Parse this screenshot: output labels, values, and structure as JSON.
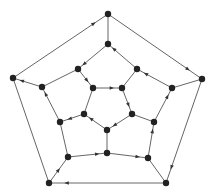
{
  "diagram": {
    "type": "graph",
    "colors": {
      "edge": "#555555",
      "node": "#222222",
      "arrow": "#333333",
      "background": "#ffffff"
    },
    "node_radius": 3.2,
    "nodes": [
      {
        "id": "n0",
        "x": 108,
        "y": 14
      },
      {
        "id": "n1",
        "x": 202,
        "y": 79
      },
      {
        "id": "n2",
        "x": 166,
        "y": 183
      },
      {
        "id": "n3",
        "x": 49,
        "y": 183
      },
      {
        "id": "n4",
        "x": 13,
        "y": 78
      },
      {
        "id": "n5",
        "x": 108,
        "y": 44
      },
      {
        "id": "n6",
        "x": 137,
        "y": 69
      },
      {
        "id": "n7",
        "x": 172,
        "y": 88
      },
      {
        "id": "n8",
        "x": 154,
        "y": 122
      },
      {
        "id": "n9",
        "x": 148,
        "y": 158
      },
      {
        "id": "n10",
        "x": 107,
        "y": 153
      },
      {
        "id": "n11",
        "x": 68,
        "y": 157
      },
      {
        "id": "n12",
        "x": 60,
        "y": 122
      },
      {
        "id": "n13",
        "x": 42,
        "y": 87
      },
      {
        "id": "n14",
        "x": 78,
        "y": 69
      },
      {
        "id": "n15",
        "x": 93,
        "y": 88
      },
      {
        "id": "n16",
        "x": 122,
        "y": 88
      },
      {
        "id": "n17",
        "x": 132,
        "y": 114
      },
      {
        "id": "n18",
        "x": 107,
        "y": 130
      },
      {
        "id": "n19",
        "x": 84,
        "y": 114
      }
    ],
    "directed_edges": [
      {
        "from": "n4",
        "to": "n0",
        "arrow_pos": 0.85
      },
      {
        "from": "n0",
        "to": "n1",
        "arrow_pos": 0.85
      },
      {
        "from": "n1",
        "to": "n2",
        "arrow_pos": 0.85
      },
      {
        "from": "n2",
        "to": "n3",
        "arrow_pos": 0.85
      },
      {
        "from": "n3",
        "to": "n11",
        "arrow_pos": 0.5
      },
      {
        "from": "n11",
        "to": "n10",
        "arrow_pos": 0.75
      },
      {
        "from": "n10",
        "to": "n9",
        "arrow_pos": 0.75
      },
      {
        "from": "n9",
        "to": "n8",
        "arrow_pos": 0.75
      },
      {
        "from": "n8",
        "to": "n7",
        "arrow_pos": 0.75
      },
      {
        "from": "n7",
        "to": "n6",
        "arrow_pos": 0.75
      },
      {
        "from": "n6",
        "to": "n5",
        "arrow_pos": 0.8
      },
      {
        "from": "n5",
        "to": "n14",
        "arrow_pos": 0.8
      },
      {
        "from": "n14",
        "to": "n15",
        "arrow_pos": 0.6
      },
      {
        "from": "n15",
        "to": "n16",
        "arrow_pos": 0.65
      },
      {
        "from": "n16",
        "to": "n17",
        "arrow_pos": 0.65
      },
      {
        "from": "n17",
        "to": "n18",
        "arrow_pos": 0.7
      },
      {
        "from": "n18",
        "to": "n19",
        "arrow_pos": 0.7
      },
      {
        "from": "n19",
        "to": "n12",
        "arrow_pos": 0.6
      },
      {
        "from": "n12",
        "to": "n13",
        "arrow_pos": 0.8
      },
      {
        "from": "n13",
        "to": "n4",
        "arrow_pos": 0.7
      }
    ],
    "undirected_edges": [
      {
        "a": "n0",
        "b": "n5"
      },
      {
        "a": "n4",
        "b": "n3"
      },
      {
        "a": "n13",
        "b": "n14"
      },
      {
        "a": "n12",
        "b": "n11"
      },
      {
        "a": "n18",
        "b": "n10"
      },
      {
        "a": "n9",
        "b": "n2"
      },
      {
        "a": "n8",
        "b": "n17"
      },
      {
        "a": "n7",
        "b": "n1"
      },
      {
        "a": "n15",
        "b": "n19"
      },
      {
        "a": "n16",
        "b": "n6"
      }
    ]
  }
}
